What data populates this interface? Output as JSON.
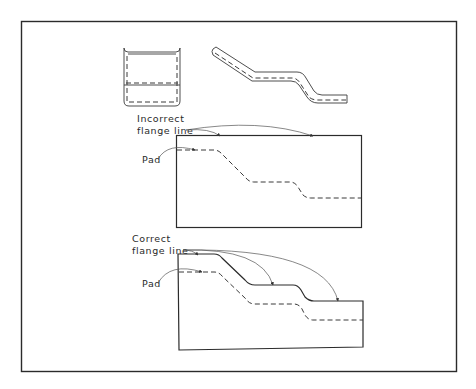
{
  "figure": {
    "type": "technical-drawing",
    "colors": {
      "background": "#ffffff",
      "line": "#2b2b2b",
      "leader": "#555555"
    }
  },
  "views": {
    "end_view": {
      "label": ""
    },
    "side_view": {
      "label": ""
    }
  },
  "incorrect_panel": {
    "callout_line1": "Incorrect",
    "callout_line2": "flange line",
    "pad_label": "Pad"
  },
  "correct_panel": {
    "callout_line1": "Correct",
    "callout_line2": "flange line",
    "pad_label": "Pad"
  }
}
